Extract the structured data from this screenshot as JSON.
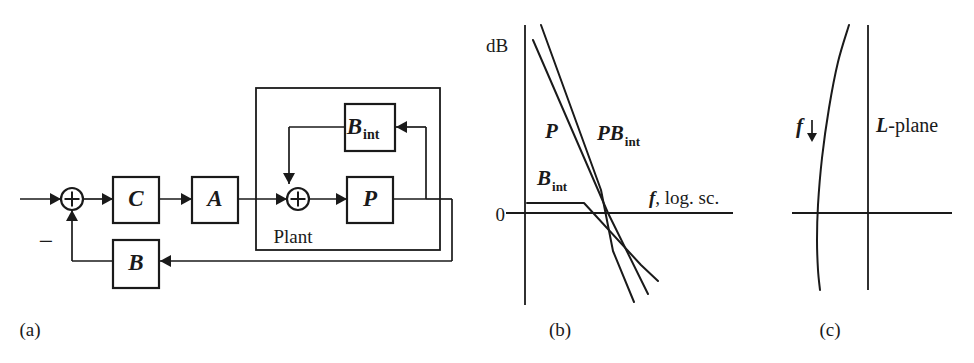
{
  "figure": {
    "width": 974,
    "height": 363,
    "background": "#ffffff",
    "ink_color": "#1a1a1a"
  },
  "panel_a": {
    "caption": "(a)",
    "caption_x": 30,
    "caption_y": 336,
    "description": "Feedback block diagram with controller C, actuator A, plant P, internal feedback B_int and outer feedback B",
    "blocks": [
      {
        "id": "C",
        "label": "C",
        "sub": "",
        "x": 113,
        "y": 177,
        "w": 46,
        "h": 46
      },
      {
        "id": "A",
        "label": "A",
        "sub": "",
        "x": 192,
        "y": 177,
        "w": 46,
        "h": 46
      },
      {
        "id": "P",
        "label": "P",
        "sub": "",
        "x": 347,
        "y": 177,
        "w": 46,
        "h": 46
      },
      {
        "id": "Bint",
        "label": "B",
        "sub": "int",
        "x": 345,
        "y": 104,
        "w": 50,
        "h": 47
      },
      {
        "id": "B",
        "label": "B",
        "sub": "",
        "x": 113,
        "y": 240,
        "w": 46,
        "h": 48
      }
    ],
    "sum_junctions": [
      {
        "id": "sum-input",
        "cx": 72,
        "cy": 199,
        "r": 11,
        "symbol": "+"
      },
      {
        "id": "sum-plant",
        "cx": 298,
        "cy": 199,
        "r": 11,
        "symbol": "+"
      }
    ],
    "plant_box": {
      "x": 256,
      "y": 88,
      "w": 184,
      "h": 162
    },
    "plant_label": {
      "text": "Plant",
      "x": 293,
      "y": 243
    },
    "minus_sign": {
      "text": "−",
      "x": 46,
      "y": 250
    },
    "signal_lines": [
      {
        "id": "input-wire",
        "points": "20,199 61,199"
      },
      {
        "id": "sum-to-C",
        "points": "83,199 113,199"
      },
      {
        "id": "C-to-A",
        "points": "159,199 192,199"
      },
      {
        "id": "A-to-sumplant",
        "points": "238,199 287,199"
      },
      {
        "id": "sumplant-to-P",
        "points": "309,199 347,199"
      },
      {
        "id": "P-output",
        "points": "393,199 426,199"
      },
      {
        "id": "internal-fb-up",
        "points": "426,199 426,127"
      },
      {
        "id": "internal-fb-left",
        "points": "426,127 396,127"
      },
      {
        "id": "bint-out-left",
        "points": "345,127 289,127"
      },
      {
        "id": "bint-down-to-sum",
        "points": "289,127 289,160"
      },
      {
        "id": "bint-into-sum",
        "points": "289,160 289,184"
      },
      {
        "id": "outer-fb-right",
        "points": "426,199 452,199"
      },
      {
        "id": "outer-fb-down",
        "points": "452,199 452,261"
      },
      {
        "id": "outer-fb-left",
        "points": "452,261 160,261"
      },
      {
        "id": "B-out-left",
        "points": "113,261 72,261"
      },
      {
        "id": "B-up-to-sum",
        "points": "72,261 72,210"
      }
    ],
    "arrowheads": [
      {
        "id": "arrow-into-sum-input",
        "x": 61,
        "y": 199,
        "dir": "right"
      },
      {
        "id": "arrow-into-C",
        "x": 113,
        "y": 199,
        "dir": "right"
      },
      {
        "id": "arrow-into-A",
        "x": 192,
        "y": 199,
        "dir": "right"
      },
      {
        "id": "arrow-into-sum-plant",
        "x": 287,
        "y": 199,
        "dir": "right"
      },
      {
        "id": "arrow-into-P",
        "x": 347,
        "y": 199,
        "dir": "right"
      },
      {
        "id": "arrow-into-bint",
        "x": 396,
        "y": 127,
        "dir": "left"
      },
      {
        "id": "arrow-into-sum-top",
        "x": 289,
        "y": 184,
        "dir": "down"
      },
      {
        "id": "arrow-into-B",
        "x": 160,
        "y": 261,
        "dir": "left"
      },
      {
        "id": "arrow-into-sum-bottom",
        "x": 72,
        "y": 210,
        "dir": "up"
      }
    ]
  },
  "panel_b": {
    "caption": "(b)",
    "caption_x": 560,
    "caption_y": 336,
    "axis_y": {
      "x": 525,
      "y_top": 25,
      "y_bottom": 305
    },
    "axis_x": {
      "y": 213,
      "x_left": 506,
      "x_right": 733
    },
    "y_axis_label": {
      "text": "dB",
      "x": 486,
      "y": 52
    },
    "zero_tick_label": {
      "text": "0",
      "x": 505,
      "y": 221
    },
    "x_axis_label": {
      "text_italic": "f",
      "text_rest": ", log. sc.",
      "x": 649,
      "y": 204
    },
    "curves": [
      {
        "id": "P",
        "label": "P",
        "label_sub": "",
        "label_x": 545,
        "label_y": 138,
        "points": "541,25 601,190 613,251 634,302"
      },
      {
        "id": "PBint",
        "label": "PB",
        "label_sub": "int",
        "label_x": 597,
        "label_y": 140,
        "points": "533,40 608,213 648,294"
      },
      {
        "id": "Bint",
        "label": "B",
        "label_sub": "int",
        "label_x": 537,
        "label_y": 185,
        "points": "527,203 584,203 641,265 658,281"
      }
    ]
  },
  "panel_c": {
    "caption": "(c)",
    "caption_x": 830,
    "caption_y": 336,
    "axis_y": {
      "x": 868,
      "y_top": 25,
      "y_bottom": 290
    },
    "axis_x": {
      "y": 213,
      "x_left": 792,
      "x_right": 952
    },
    "plane_label": {
      "text_italic": "L",
      "text_rest": "-plane",
      "x": 876,
      "y": 132
    },
    "freq_marker": {
      "label": "f",
      "label_x": 796,
      "label_y": 133,
      "arrow_x": 812,
      "arrow_y_start": 120,
      "arrow_y_end": 142
    },
    "locus": {
      "id": "L-locus",
      "points": "849,25 838,62 829,108 822,158 818,205 817,240 818,270 820,290"
    }
  },
  "chart_data": [
    {
      "type": "line",
      "panel": "(b)",
      "title": "Bode magnitude asymptotes",
      "xlabel": "f, log. sc.",
      "ylabel": "dB",
      "grid": false,
      "legend": "inline-annotations",
      "series": [
        {
          "name": "P",
          "description": "plant magnitude, steep roll-off from high gain, crosses 0 dB"
        },
        {
          "name": "PBint",
          "description": "plant times internal feedback, slightly lower and shallower, crosses 0 dB later"
        },
        {
          "name": "Bint",
          "description": "internal feedback, flat low gain then breaks downward, crosses 0 dB"
        }
      ],
      "annotations": [
        "dB",
        "0",
        "f, log. sc.",
        "P",
        "PBint",
        "Bint"
      ]
    },
    {
      "type": "line",
      "panel": "(c)",
      "title": "L-plane locus",
      "xlabel": "",
      "ylabel": "",
      "grid": false,
      "legend": "inline-annotations",
      "series": [
        {
          "name": "L-locus",
          "description": "Nichols/Nyquist-style locus bending leftward then back, crossing the real axis left of the vertical axis"
        }
      ],
      "annotations": [
        "f",
        "L-plane"
      ]
    }
  ]
}
